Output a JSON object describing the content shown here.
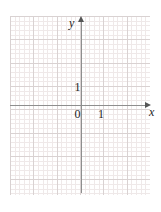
{
  "figure": {
    "type": "cartesian-coordinate-grid",
    "width": 161,
    "height": 212,
    "background_color": "#ffffff"
  },
  "axes": {
    "x_axis": {
      "label": "x",
      "color": "#8e8e8e",
      "arrow_direction": "right"
    },
    "y_axis": {
      "label": "y",
      "color": "#8e8e8e",
      "arrow_direction": "up"
    }
  },
  "tick_labels": {
    "origin": "0",
    "x_unit": "1",
    "y_unit": "1"
  },
  "grid": {
    "major_color": "#d9d2d2",
    "minor_color": "#efe9e9",
    "major_spacing_px": 23.333,
    "minor_divisions_per_major": 5,
    "show_minor": true,
    "show_major": true
  },
  "chart_data": {
    "type": "scatter",
    "title": "",
    "subtitle": "",
    "xlabel": "x",
    "ylabel": "y",
    "series": [
      {
        "name": "",
        "x": [],
        "y": []
      }
    ],
    "xlim": [
      -3,
      3
    ],
    "ylim": [
      -4,
      4
    ],
    "xticks": [
      0,
      1
    ],
    "yticks": [
      0,
      1
    ],
    "xtick_labels": [
      "0",
      "1"
    ],
    "ytick_labels": [
      "0",
      "1"
    ],
    "grid": true,
    "legend": null,
    "annotations": []
  }
}
